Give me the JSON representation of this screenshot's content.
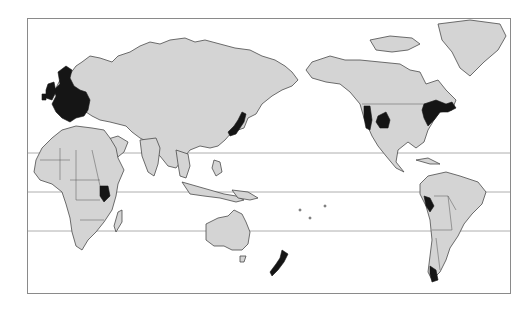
{
  "map": {
    "projection": "pacific-centered world map",
    "colors": {
      "land": "#d4d4d4",
      "highlighted": "#151515",
      "ocean": "#ffffff",
      "outline": "#4a4a4a",
      "latitude_lines": "#9a9a9a"
    },
    "latitude_lines": [
      "tropic-of-cancer",
      "equator",
      "tropic-of-capricorn"
    ],
    "highlighted_regions": [
      "Western & Northern Europe",
      "Japan",
      "East Africa (Kenya)",
      "New Zealand",
      "Western United States (Pacific coast)",
      "Rocky Mountain region (US)",
      "Northeastern United States & Southeastern Canada",
      "Peru (coast)",
      "Southern Chile"
    ]
  }
}
